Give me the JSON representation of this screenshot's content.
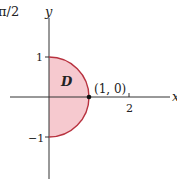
{
  "caption_fragment": "π/2",
  "axes": {
    "x_label": "x",
    "y_label": "y",
    "ticks": {
      "y_pos": "1",
      "y_neg": "−1",
      "x_two": "2"
    }
  },
  "region": {
    "label": "D",
    "fill_color": "#f6c9cf",
    "boundary_color": "#b8323f"
  },
  "point": {
    "label": "(1, 0)",
    "color": "#111111"
  },
  "colors": {
    "axis": "#333333",
    "background": "#ffffff"
  }
}
